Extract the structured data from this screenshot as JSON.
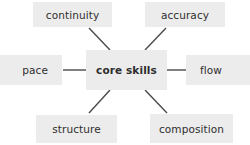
{
  "diagram": {
    "type": "mind-map",
    "background_color": "#ffffff",
    "node_fill_color": "#ececec",
    "node_text_color": "#2e2e2e",
    "connector_color": "#4a4a4a",
    "center": {
      "id": "core-skills",
      "label": "core skills",
      "emphasis": "bold"
    },
    "branches": [
      {
        "id": "continuity",
        "label": "continuity",
        "position": "top-left"
      },
      {
        "id": "accuracy",
        "label": "accuracy",
        "position": "top-right"
      },
      {
        "id": "pace",
        "label": "pace",
        "position": "left"
      },
      {
        "id": "flow",
        "label": "flow",
        "position": "right"
      },
      {
        "id": "structure",
        "label": "structure",
        "position": "bottom-left"
      },
      {
        "id": "composition",
        "label": "composition",
        "position": "bottom-right"
      }
    ],
    "connectors": [
      {
        "from": "core-skills",
        "to": "continuity",
        "style": "diagonal"
      },
      {
        "from": "core-skills",
        "to": "accuracy",
        "style": "diagonal"
      },
      {
        "from": "core-skills",
        "to": "pace",
        "style": "horizontal"
      },
      {
        "from": "core-skills",
        "to": "flow",
        "style": "horizontal"
      },
      {
        "from": "core-skills",
        "to": "structure",
        "style": "diagonal"
      },
      {
        "from": "core-skills",
        "to": "composition",
        "style": "diagonal"
      }
    ]
  }
}
